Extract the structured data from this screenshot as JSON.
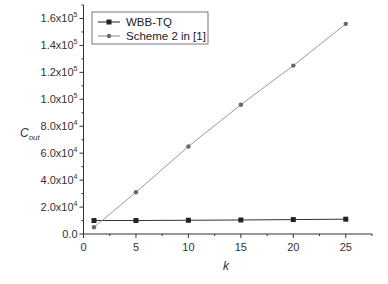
{
  "chart_data": {
    "type": "line",
    "title": "",
    "xlabel": "k",
    "ylabel": "C_out",
    "ylabel_main": "C",
    "ylabel_sub": "out",
    "xlim": [
      0,
      27.5
    ],
    "ylim": [
      0,
      170000
    ],
    "grid": false,
    "legend_position": "upper left",
    "x": [
      1,
      5,
      10,
      15,
      20,
      25
    ],
    "series": [
      {
        "name": "WBB-TQ",
        "color": "#222222",
        "marker": "square",
        "values": [
          10000,
          10000,
          10200,
          10400,
          10700,
          11000
        ]
      },
      {
        "name": "Scheme 2 in [1]",
        "color": "#777777",
        "marker": "circle",
        "values": [
          5000,
          31000,
          65000,
          96000,
          125000,
          156000
        ]
      }
    ],
    "xticks": [
      {
        "value": 0,
        "label": "0"
      },
      {
        "value": 5,
        "label": "5"
      },
      {
        "value": 10,
        "label": "10"
      },
      {
        "value": 15,
        "label": "15"
      },
      {
        "value": 20,
        "label": "20"
      },
      {
        "value": 25,
        "label": "25"
      }
    ],
    "yticks": [
      {
        "value": 0,
        "mant": "0.0",
        "exp": ""
      },
      {
        "value": 20000,
        "mant": "2.0x10",
        "exp": "4"
      },
      {
        "value": 40000,
        "mant": "4.0x10",
        "exp": "4"
      },
      {
        "value": 60000,
        "mant": "6.0x10",
        "exp": "4"
      },
      {
        "value": 80000,
        "mant": "8.0x10",
        "exp": "4"
      },
      {
        "value": 100000,
        "mant": "1.0x10",
        "exp": "5"
      },
      {
        "value": 120000,
        "mant": "1.2x10",
        "exp": "5"
      },
      {
        "value": 140000,
        "mant": "1.4x10",
        "exp": "5"
      },
      {
        "value": 160000,
        "mant": "1.6x10",
        "exp": "5"
      }
    ]
  }
}
